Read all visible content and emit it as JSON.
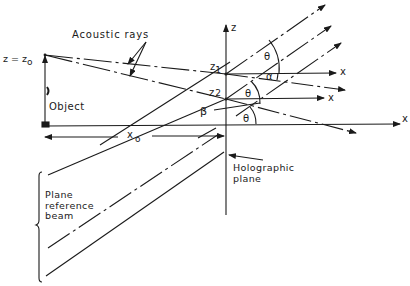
{
  "diagram": {
    "labels": {
      "acoustic_rays": "Acoustic rays",
      "z_eq_z0": "z = z",
      "z0_sub": "o",
      "object": "Object",
      "x0": "x",
      "x0_sub": "o",
      "z_axis": "z",
      "x_axis": "x",
      "x_axis_1": "x",
      "x_axis_2": "x",
      "z1": "z",
      "z1_sub": "1",
      "z2": "z",
      "z2_sub": "2",
      "theta_1": "θ",
      "theta_2": "θ",
      "theta_3": "θ",
      "alpha": "α",
      "beta": "β",
      "holographic_plane_1": "Holographic",
      "holographic_plane_2": "plane",
      "reference_beam_1": "Plane",
      "reference_beam_2": "reference",
      "reference_beam_3": "beam"
    },
    "colors": {
      "ink": "#1a1a1a",
      "background": "#ffffff"
    }
  }
}
